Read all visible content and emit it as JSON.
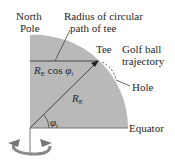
{
  "diagram": {
    "labels": {
      "north_pole_line1": "North",
      "north_pole_line2": "Pole",
      "radius_desc_line1": "Radius of circular",
      "radius_desc_line2": "path of tee",
      "tee": "Tee",
      "golf_line1": "Golf ball",
      "golf_line2": "trajectory",
      "hole": "Hole",
      "equator": "Equator",
      "r_cos_R": "R",
      "r_cos_sub": "E",
      "r_cos_mid": " cos ",
      "r_cos_phi": "φ",
      "r_cos_phi_sub": "i",
      "re_R": "R",
      "re_sub": "E",
      "phi": "φ",
      "phi_sub": "i"
    },
    "colors": {
      "earth_fill": "#b9b9b9",
      "line": "#444444",
      "rotation_arrow": "#8a8a8a"
    },
    "icons": [
      "rotation-arrow-icon"
    ]
  }
}
